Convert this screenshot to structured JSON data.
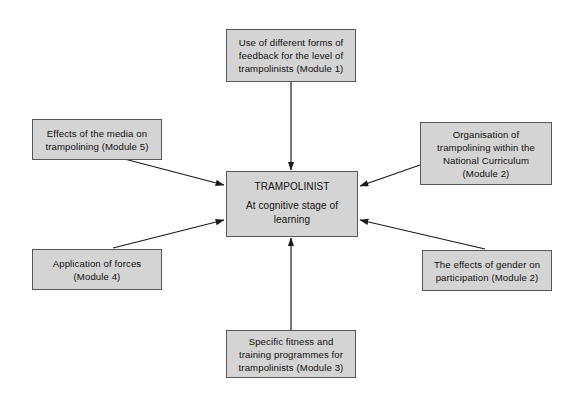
{
  "diagram": {
    "title_node": {
      "name": "trampolinist-center",
      "title": "TRAMPOLINIST",
      "subtitle_lines": [
        "At cognitive stage of",
        "learning"
      ]
    },
    "nodes": [
      {
        "id": "feedback",
        "name": "node-feedback-module-1",
        "lines": [
          "Use of different forms of",
          "feedback for the level of",
          "trampolinists (Module 1)"
        ]
      },
      {
        "id": "media",
        "name": "node-media-module-5",
        "lines": [
          "Effects of the media on",
          "trampolining (Module 5)"
        ]
      },
      {
        "id": "organisation",
        "name": "node-organisation-module-2",
        "lines": [
          "Organisation of",
          "trampolining within the",
          "National Curriculum",
          "(Module 2)"
        ]
      },
      {
        "id": "forces",
        "name": "node-forces-module-4",
        "lines": [
          "Application of forces",
          "(Module 4)"
        ]
      },
      {
        "id": "gender",
        "name": "node-gender-module-2",
        "lines": [
          "The effects of gender on",
          "participation (Module 2)"
        ]
      },
      {
        "id": "fitness",
        "name": "node-fitness-module-3",
        "lines": [
          "Specific fitness and",
          "training programmes for",
          "trampolinists (Module 3)"
        ]
      }
    ],
    "colors": {
      "node_fill": "#d4d4d4",
      "node_border": "#58585a",
      "arrow": "#1a1a1a",
      "background": "#ffffff",
      "text": "#111111"
    },
    "arrows": [
      {
        "name": "arrow-feedback-to-center",
        "from": "feedback",
        "to": "trampolinist-center"
      },
      {
        "name": "arrow-media-to-center",
        "from": "media",
        "to": "trampolinist-center"
      },
      {
        "name": "arrow-organisation-to-center",
        "from": "organisation",
        "to": "trampolinist-center"
      },
      {
        "name": "arrow-forces-to-center",
        "from": "forces",
        "to": "trampolinist-center"
      },
      {
        "name": "arrow-gender-to-center",
        "from": "gender",
        "to": "trampolinist-center"
      },
      {
        "name": "arrow-fitness-to-center",
        "from": "fitness",
        "to": "trampolinist-center"
      }
    ]
  }
}
